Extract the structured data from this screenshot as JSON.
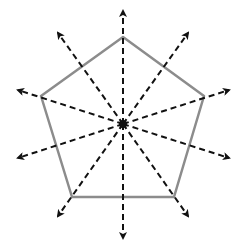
{
  "diagram": {
    "title": "",
    "colors": {
      "background": "#ffffff",
      "pentagon_stroke": "#8c8c8c",
      "arrow_stroke": "#111111",
      "center_mark": "#111111"
    },
    "center": [
      123,
      124
    ],
    "pentagon_vertices": [
      [
        123,
        37
      ],
      [
        204,
        96
      ],
      [
        174,
        197
      ],
      [
        72,
        197
      ],
      [
        41,
        96
      ]
    ],
    "arrows": [
      {
        "name": "arrow-up",
        "tip": [
          123,
          11
        ]
      },
      {
        "name": "arrow-down",
        "tip": [
          123,
          238
        ]
      },
      {
        "name": "arrow-upper-right",
        "tip": [
          188,
          33
        ]
      },
      {
        "name": "arrow-lower-left",
        "tip": [
          58,
          216
        ]
      },
      {
        "name": "arrow-upper-left",
        "tip": [
          58,
          33
        ]
      },
      {
        "name": "arrow-lower-right",
        "tip": [
          188,
          216
        ]
      },
      {
        "name": "arrow-right-upper",
        "tip": [
          229,
          90
        ]
      },
      {
        "name": "arrow-left-lower",
        "tip": [
          18,
          158
        ]
      },
      {
        "name": "arrow-left-upper",
        "tip": [
          18,
          90
        ]
      },
      {
        "name": "arrow-right-lower",
        "tip": [
          229,
          158
        ]
      }
    ]
  }
}
